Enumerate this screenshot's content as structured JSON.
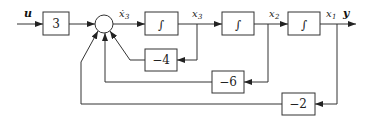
{
  "diagram": {
    "type": "block-diagram",
    "input_label": "u",
    "output_label": "y",
    "forward_path": [
      {
        "block": "gain",
        "label": "3"
      },
      {
        "block": "summing_junction",
        "output_label": "ẋ3"
      },
      {
        "block": "integrator",
        "label": "∫",
        "output_label": "x3"
      },
      {
        "block": "integrator",
        "label": "∫",
        "output_label": "x2"
      },
      {
        "block": "integrator",
        "label": "∫",
        "output_label": "x1"
      }
    ],
    "feedback_paths": [
      {
        "from": "x3",
        "gain": "−4",
        "to": "summing_junction"
      },
      {
        "from": "x2",
        "gain": "−6",
        "to": "summing_junction"
      },
      {
        "from": "x1",
        "gain": "−2",
        "to": "summing_junction"
      }
    ],
    "labels": {
      "gain_input": "3",
      "sum_out_main": "ẋ",
      "sum_out_sub": "3",
      "int1": "∫",
      "int2": "∫",
      "int3": "∫",
      "x3_main": "x",
      "x3_sub": "3",
      "x2_main": "x",
      "x2_sub": "2",
      "x1_main": "x",
      "x1_sub": "1",
      "fb_x3": "−4",
      "fb_x2": "−6",
      "fb_x1": "−2"
    }
  }
}
